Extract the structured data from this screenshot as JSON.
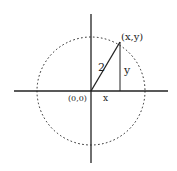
{
  "diagram": {
    "type": "unit-circle-coordinate-diagram",
    "colors": {
      "ink": "#222222",
      "background": "#ffffff"
    },
    "origin": {
      "cx": 91,
      "cy": 91
    },
    "circle": {
      "radius": 54,
      "style": "dashed"
    },
    "axes": {
      "horizontal": {
        "x1": 14,
        "x2": 168,
        "y": 91
      },
      "vertical": {
        "y1": 14,
        "y2": 163,
        "x": 91
      }
    },
    "point": {
      "x": 120,
      "y": 42
    },
    "labels": {
      "point": "(x,y)",
      "origin": "(0,0)",
      "hypotenuse": "2",
      "horizontal_leg": "x",
      "vertical_leg": "y"
    }
  }
}
